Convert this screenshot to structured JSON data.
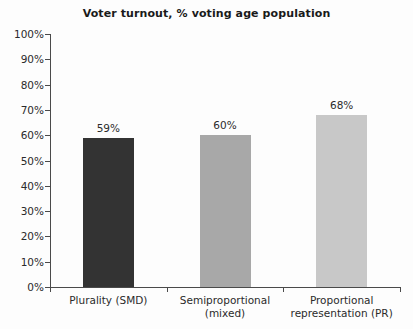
{
  "chart_data": {
    "type": "bar",
    "title": "Voter turnout, % voting age population",
    "xlabel": "",
    "ylabel": "",
    "categories": [
      "Plurality (SMD)",
      "Semiproportional (mixed)",
      "Proportional representation (PR)"
    ],
    "category_lines": [
      [
        "Plurality (SMD)"
      ],
      [
        "Semiproportional",
        "(mixed)"
      ],
      [
        "Proportional",
        "representation (PR)"
      ]
    ],
    "values": [
      59,
      60,
      68
    ],
    "value_labels": [
      "59%",
      "60%",
      "68%"
    ],
    "bar_colors": [
      "#333333",
      "#a8a8a8",
      "#c8c8c8"
    ],
    "ylim": [
      0,
      100
    ],
    "ytick_values": [
      0,
      10,
      20,
      30,
      40,
      50,
      60,
      70,
      80,
      90,
      100
    ],
    "ytick_labels": [
      "0%",
      "10%",
      "20%",
      "30%",
      "40%",
      "50%",
      "60%",
      "70%",
      "80%",
      "90%",
      "100%"
    ],
    "grid": false,
    "legend": null,
    "axis_color": "#4a4a4a",
    "text_color": "#2b2b2b",
    "background": "#fdfdfd"
  }
}
